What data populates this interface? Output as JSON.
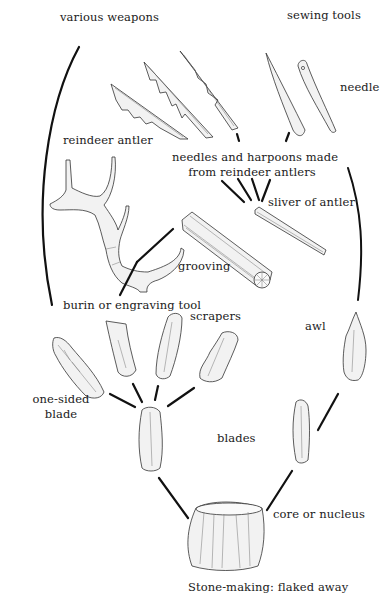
{
  "diagram": {
    "title_caption": "Stone-making: flaked away",
    "labels": {
      "various_weapons": "various weapons",
      "sewing_tools": "sewing tools",
      "needle": "needle",
      "reindeer_antler": "reindeer antler",
      "needles_harpoons_line1": "needles and harpoons made",
      "needles_harpoons_line2": "from reindeer antlers",
      "sliver_of_antler": "sliver of antler",
      "grooving": "grooving",
      "burin": "burin or engraving tool",
      "scrapers": "scrapers",
      "awl": "awl",
      "one_sided_line1": "one-sided",
      "one_sided_line2": "blade",
      "blades": "blades",
      "core_or_nucleus": "core or nucleus"
    },
    "nodes": [
      {
        "id": "core",
        "label": "core or nucleus"
      },
      {
        "id": "blade-left",
        "label": "blades"
      },
      {
        "id": "blade-right",
        "label": "blades"
      },
      {
        "id": "one-sided-blade",
        "label": "one-sided blade"
      },
      {
        "id": "burin",
        "label": "burin or engraving tool"
      },
      {
        "id": "scrapers",
        "label": "scrapers"
      },
      {
        "id": "awl",
        "label": "awl"
      },
      {
        "id": "reindeer-antler",
        "label": "reindeer antler"
      },
      {
        "id": "grooving",
        "label": "grooving"
      },
      {
        "id": "sliver",
        "label": "sliver of antler"
      },
      {
        "id": "needles-harpoons",
        "label": "needles and harpoons made from reindeer antlers"
      },
      {
        "id": "weapons",
        "label": "various weapons"
      },
      {
        "id": "sewing",
        "label": "sewing tools"
      },
      {
        "id": "needle",
        "label": "needle"
      }
    ],
    "edges": [
      [
        "core",
        "blade-left"
      ],
      [
        "core",
        "blade-right"
      ],
      [
        "blade-left",
        "one-sided-blade"
      ],
      [
        "blade-left",
        "burin"
      ],
      [
        "blade-left",
        "scrapers"
      ],
      [
        "blade-right",
        "awl"
      ],
      [
        "burin",
        "grooving"
      ],
      [
        "grooving",
        "sliver"
      ],
      [
        "sliver",
        "needles-harpoons"
      ],
      [
        "needles-harpoons",
        "weapons"
      ],
      [
        "needles-harpoons",
        "sewing"
      ],
      [
        "awl",
        "sewing"
      ],
      [
        "one-sided-blade",
        "weapons"
      ]
    ]
  }
}
